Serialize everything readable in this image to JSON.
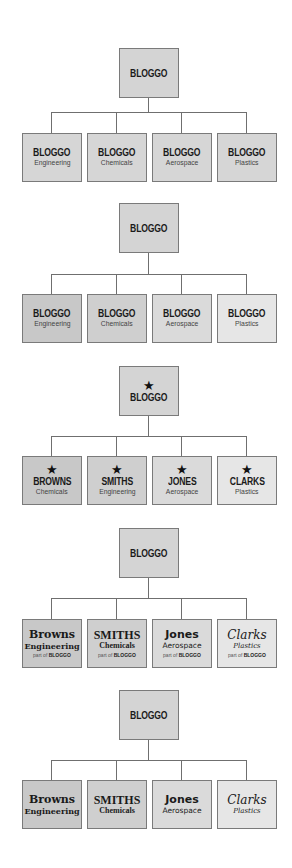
{
  "colors": {
    "top_box": "#d4d4d4",
    "uniform_child": "#d6d6d6",
    "graded_children": [
      "#c8c8c8",
      "#cfcfcf",
      "#dadada",
      "#e6e6e6"
    ],
    "border": "#7a7a7a",
    "connector": "#6f6f6f"
  },
  "charts": [
    {
      "top": {
        "label": "BLOGGO"
      },
      "children": [
        {
          "name": "BLOGGO",
          "sub": "Engineering"
        },
        {
          "name": "BLOGGO",
          "sub": "Chemicals"
        },
        {
          "name": "BLOGGO",
          "sub": "Aerospace"
        },
        {
          "name": "BLOGGO",
          "sub": "Plastics"
        }
      ]
    },
    {
      "top": {
        "label": "BLOGGO"
      },
      "children": [
        {
          "name": "BLOGGO",
          "sub": "Engineering"
        },
        {
          "name": "BLOGGO",
          "sub": "Chemicals"
        },
        {
          "name": "BLOGGO",
          "sub": "Aerospace"
        },
        {
          "name": "BLOGGO",
          "sub": "Plastics"
        }
      ]
    },
    {
      "top": {
        "icon": "★",
        "label": "BLOGGO"
      },
      "children": [
        {
          "icon": "★",
          "name": "BROWNS",
          "sub": "Chemicals"
        },
        {
          "icon": "★",
          "name": "SMITHS",
          "sub": "Engineering"
        },
        {
          "icon": "★",
          "name": "JONES",
          "sub": "Aerospace"
        },
        {
          "icon": "★",
          "name": "CLARKS",
          "sub": "Plastics"
        }
      ]
    },
    {
      "top": {
        "label": "BLOGGO"
      },
      "children": [
        {
          "name": "Browns",
          "sub": "Engineering",
          "part_prefix": "part of",
          "part_brand": "BLOGGO"
        },
        {
          "name": "SMITHS",
          "sub": "Chemicals",
          "part_prefix": "part of",
          "part_brand": "BLOGGO"
        },
        {
          "name": "Jones",
          "sub": "Aerospace",
          "part_prefix": "part of",
          "part_brand": "BLOGGO"
        },
        {
          "name": "Clarks",
          "sub": "Plastics",
          "part_prefix": "part of",
          "part_brand": "BLOGGO"
        }
      ]
    },
    {
      "top": {
        "label": "BLOGGO"
      },
      "children": [
        {
          "name": "Browns",
          "sub": "Engineering"
        },
        {
          "name": "SMITHS",
          "sub": "Chemicals"
        },
        {
          "name": "Jones",
          "sub": "Aerospace"
        },
        {
          "name": "Clarks",
          "sub": "Plastics"
        }
      ]
    }
  ]
}
